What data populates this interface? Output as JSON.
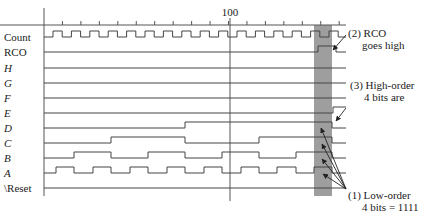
{
  "diagram": {
    "type": "timing-diagram",
    "axis": {
      "marker_label": "100",
      "marker_x": 230,
      "x0": 44,
      "x_end": 346,
      "y": 25,
      "tick_spacing": 18.45,
      "bottom": 196
    },
    "highlight": {
      "x": 314,
      "width": 18,
      "color": "#9e9e9e"
    },
    "signals": [
      {
        "name": "Count",
        "italic": false,
        "y": 37,
        "kind": "clock",
        "start": 53,
        "half": 9.2,
        "end": 346
      },
      {
        "name": "RCO",
        "italic": false,
        "y": 52,
        "edges": [
          318,
          336
        ],
        "initial": 0
      },
      {
        "name": "H",
        "italic": true,
        "y": 68,
        "edges": [],
        "initial": 0
      },
      {
        "name": "G",
        "italic": true,
        "y": 83,
        "edges": [],
        "initial": 0
      },
      {
        "name": "F",
        "italic": true,
        "y": 98,
        "edges": [],
        "initial": 0
      },
      {
        "name": "E",
        "italic": true,
        "y": 113,
        "edges": [
          333
        ],
        "initial": 0
      },
      {
        "name": "D",
        "italic": true,
        "y": 128,
        "edges": [
          185,
          332
        ],
        "initial": 0
      },
      {
        "name": "C",
        "italic": true,
        "y": 143,
        "edges": [
          111,
          185,
          259,
          332
        ],
        "initial": 0
      },
      {
        "name": "B",
        "italic": true,
        "y": 158,
        "edges": [
          74,
          111,
          148,
          185,
          222,
          259,
          296,
          332
        ],
        "initial": 0
      },
      {
        "name": "A",
        "italic": true,
        "y": 173,
        "edges": [
          56,
          74,
          93,
          111,
          130,
          148,
          167,
          185,
          204,
          222,
          241,
          259,
          277,
          296,
          314,
          332
        ],
        "initial": 0
      },
      {
        "name": "\\Reset",
        "italic": false,
        "y": 188,
        "edges": [],
        "initial": 0
      }
    ],
    "annotations": [
      {
        "id": "rco",
        "lines": [
          "(2) RCO",
          "goes high"
        ],
        "x": 348,
        "y": 37,
        "indent": 14
      },
      {
        "id": "high-order",
        "lines": [
          "(3) High-order",
          "4 bits are"
        ],
        "x": 350,
        "y": 89,
        "indent": 14
      },
      {
        "id": "low-order",
        "lines": [
          "(1) Low-order",
          "4 bits = 1111"
        ],
        "x": 348,
        "y": 199,
        "indent": 14
      }
    ],
    "arrows": [
      {
        "from": [
          346,
          35
        ],
        "to": [
          333,
          50
        ]
      },
      {
        "from": [
          346,
          108
        ],
        "to": [
          336,
          121
        ]
      },
      {
        "from": [
          346,
          189
        ],
        "to": [
          321,
          128
        ]
      },
      {
        "from": [
          346,
          189
        ],
        "to": [
          322,
          144
        ]
      },
      {
        "from": [
          346,
          189
        ],
        "to": [
          322,
          159
        ]
      },
      {
        "from": [
          346,
          189
        ],
        "to": [
          323,
          174
        ]
      }
    ]
  }
}
